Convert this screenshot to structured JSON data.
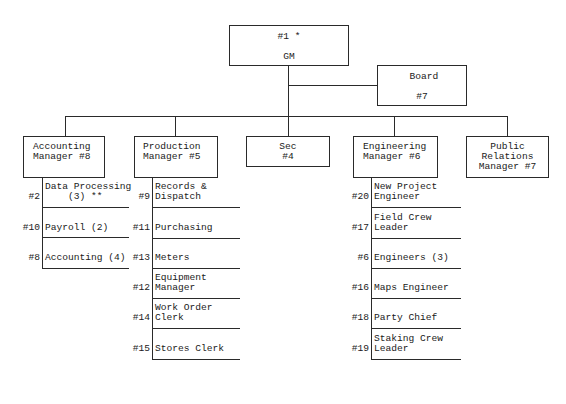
{
  "chart": {
    "gm": {
      "line1": "#1 *",
      "line2": "GM"
    },
    "board": {
      "line1": "Board",
      "line2": "#7"
    },
    "departments": [
      {
        "id": "accounting",
        "title_line1": "Accounting",
        "title_line2": "Manager #8",
        "items": [
          {
            "num": "#2",
            "line1": "Data Processing",
            "line2": "    (3) **"
          },
          {
            "num": "#10",
            "line1": "Payroll (2)",
            "line2": ""
          },
          {
            "num": "#8",
            "line1": "Accounting (4)",
            "line2": ""
          }
        ]
      },
      {
        "id": "production",
        "title_line1": "Production",
        "title_line2": "Manager #5",
        "items": [
          {
            "num": "#9",
            "line1": "Records &",
            "line2": "Dispatch"
          },
          {
            "num": "#11",
            "line1": "Purchasing",
            "line2": ""
          },
          {
            "num": "#13",
            "line1": "Meters",
            "line2": ""
          },
          {
            "num": "#12",
            "line1": "Equipment",
            "line2": "Manager"
          },
          {
            "num": "#14",
            "line1": "Work Order",
            "line2": "Clerk"
          },
          {
            "num": "#15",
            "line1": "Stores Clerk",
            "line2": ""
          }
        ]
      },
      {
        "id": "sec",
        "title_line1": "Sec",
        "title_line2": "#4",
        "items": []
      },
      {
        "id": "engineering",
        "title_line1": "Engineering",
        "title_line2": "Manager #6",
        "items": [
          {
            "num": "#20",
            "line1": "New Project",
            "line2": "Engineer"
          },
          {
            "num": "#17",
            "line1": "Field Crew",
            "line2": "Leader"
          },
          {
            "num": "#6",
            "line1": "Engineers (3)",
            "line2": ""
          },
          {
            "num": "#16",
            "line1": "Maps Engineer",
            "line2": ""
          },
          {
            "num": "#18",
            "line1": "Party Chief",
            "line2": ""
          },
          {
            "num": "#19",
            "line1": "Staking Crew",
            "line2": "Leader"
          }
        ]
      },
      {
        "id": "public-relations",
        "title_line1": "Public",
        "title_line2": "Relations",
        "title_line3": "Manager #7",
        "items": []
      }
    ]
  }
}
